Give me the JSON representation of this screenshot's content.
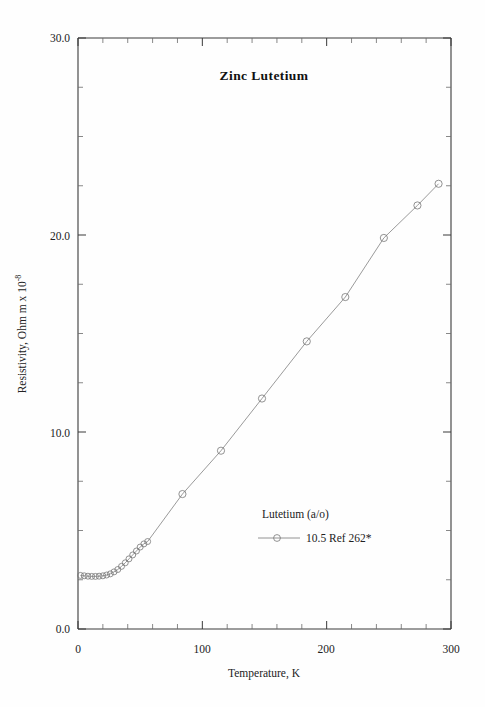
{
  "figure": {
    "title": "Zinc Lutetium",
    "background_color": "#fefefe",
    "line_color": "#888888",
    "axis_color": "#3a3a3a",
    "text_color": "#222222"
  },
  "axes": {
    "x_label": "Temperature,  K",
    "y_label_main": "Resistivity, Ohm m x 10",
    "y_label_exponent": "-8",
    "x_ticks": [
      "0",
      "100",
      "200",
      "300"
    ],
    "y_ticks": [
      "0.0",
      "10.0",
      "20.0",
      "30.0"
    ]
  },
  "legend": {
    "header": "Lutetium (a/o)",
    "entries": [
      {
        "label": "10.5 Ref 262*",
        "marker": "open-circle"
      }
    ]
  },
  "chart_data": {
    "type": "line",
    "title": "Zinc Lutetium",
    "xlabel": "Temperature, K",
    "ylabel": "Resistivity, Ohm m x 10^-8",
    "xlim": [
      0,
      300
    ],
    "ylim": [
      0.0,
      30.0
    ],
    "x_major_tick_step": 100,
    "x_minor_tick_step": 20,
    "y_major_tick_step": 10,
    "y_minor_tick_step": 2.5,
    "grid": false,
    "legend_position": "inside-lower-right",
    "series": [
      {
        "name": "10.5 Ref 262*",
        "marker": "open-circle",
        "x": [
          2,
          5,
          8,
          11,
          14,
          17,
          20,
          23,
          26,
          29,
          32,
          35,
          38,
          41,
          44,
          47,
          50,
          53,
          56,
          84,
          115,
          148,
          184,
          215,
          246,
          273,
          290
        ],
        "y": [
          2.72,
          2.7,
          2.68,
          2.67,
          2.67,
          2.68,
          2.7,
          2.74,
          2.8,
          2.9,
          3.02,
          3.18,
          3.36,
          3.56,
          3.76,
          3.96,
          4.16,
          4.32,
          4.44,
          6.85,
          9.05,
          11.7,
          14.6,
          16.85,
          19.85,
          21.5,
          22.6
        ]
      }
    ]
  },
  "plot_geometry": {
    "left_px": 78,
    "right_px": 451,
    "top_px": 38,
    "bottom_px": 629
  }
}
